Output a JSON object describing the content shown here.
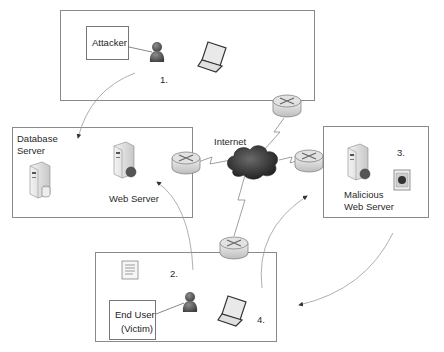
{
  "diagram": {
    "type": "network-attack-diagram",
    "zones": {
      "attacker": {
        "label": "Attacker",
        "step": "1."
      },
      "servers": {
        "db_label_line1": "Database",
        "db_label_line2": "Server",
        "web_label": "Web Server"
      },
      "malicious": {
        "label_line1": "Malicious",
        "label_line2": "Web Server",
        "step": "3."
      },
      "victim": {
        "label_line1": "End User",
        "label_line2": "(Victim)",
        "step_2": "2.",
        "step_4": "4."
      }
    },
    "internet_label": "Internet",
    "colors": {
      "border": "#8a8a8a",
      "arrow": "#9a9a9a",
      "cloud": "#3a3a3a",
      "person": "#5a5a5a"
    },
    "nodes": [
      {
        "id": "attacker-person",
        "icon": "person-icon"
      },
      {
        "id": "attacker-laptop",
        "icon": "laptop-icon"
      },
      {
        "id": "database-server",
        "icon": "database-server-icon"
      },
      {
        "id": "web-server",
        "icon": "web-server-icon"
      },
      {
        "id": "malicious-web-server",
        "icon": "web-server-icon"
      },
      {
        "id": "malicious-payload",
        "icon": "bug-badge-icon"
      },
      {
        "id": "victim-person",
        "icon": "person-icon"
      },
      {
        "id": "victim-laptop",
        "icon": "laptop-icon"
      },
      {
        "id": "victim-document",
        "icon": "document-icon"
      },
      {
        "id": "internet-cloud",
        "icon": "cloud-icon"
      },
      {
        "id": "router-top",
        "icon": "router-icon"
      },
      {
        "id": "router-left",
        "icon": "router-icon"
      },
      {
        "id": "router-right",
        "icon": "router-icon"
      },
      {
        "id": "router-bottom",
        "icon": "router-icon"
      }
    ],
    "flows": [
      {
        "step": "1.",
        "from": "attacker",
        "to": "web-server zone"
      },
      {
        "step": "2.",
        "from": "victim",
        "to": "web-server"
      },
      {
        "step": "3.",
        "from": "malicious-web-server",
        "to": "victim"
      },
      {
        "step": "4.",
        "from": "victim",
        "to": "malicious-web-server"
      }
    ]
  }
}
